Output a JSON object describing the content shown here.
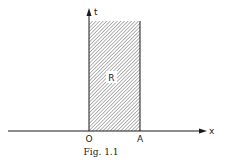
{
  "figure": {
    "caption": "Fig. 1.1",
    "axes": {
      "horizontal_label": "x",
      "vertical_label": "t"
    },
    "points": {
      "origin": "O",
      "right_end": "A"
    },
    "region": {
      "label": "R",
      "fill": "hatched"
    },
    "colors": {
      "ink": "#1a1a1a",
      "background": "#ffffff"
    }
  }
}
